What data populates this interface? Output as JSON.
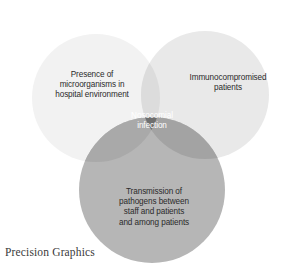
{
  "diagram": {
    "type": "venn-3-circle",
    "background_color": "#ffffff",
    "sets": [
      {
        "id": "environment",
        "label_lines": [
          "Presence of",
          "microorganisms in",
          "hospital environment"
        ],
        "color": "#f2f2f2",
        "text_color": "#2b2b2b",
        "center": {
          "x": 96,
          "y": 98
        },
        "radius": 64,
        "label_pos": {
          "x": 92,
          "y": 77
        }
      },
      {
        "id": "immunocompromised",
        "label_lines": [
          "Immunocompromised",
          "patients"
        ],
        "color": "#e9e9e9",
        "text_color": "#2b2b2b",
        "center": {
          "x": 205,
          "y": 95
        },
        "radius": 64,
        "label_pos": {
          "x": 228,
          "y": 80
        }
      },
      {
        "id": "transmission",
        "label_lines": [
          "Transmission of",
          "pathogens between",
          "staff and patients",
          "and among patients"
        ],
        "color": "#b6b6b6",
        "text_color": "#2b2b2b",
        "center": {
          "x": 152,
          "y": 190
        },
        "radius": 73,
        "label_pos": {
          "x": 154,
          "y": 194
        }
      }
    ],
    "intersection": {
      "id": "nosocomial-infection",
      "label_lines": [
        "Nosocomial",
        "infection"
      ],
      "color": "#6f6f6f",
      "text_color": "#ffffff",
      "label_pos": {
        "x": 152,
        "y": 118
      }
    },
    "pair_overlap_colors": {
      "left_right": "#dcdcdc",
      "left_bottom": "#a9a9a9",
      "right_bottom": "#a3a3a3"
    }
  },
  "caption": {
    "text": "Precision Graphics"
  }
}
